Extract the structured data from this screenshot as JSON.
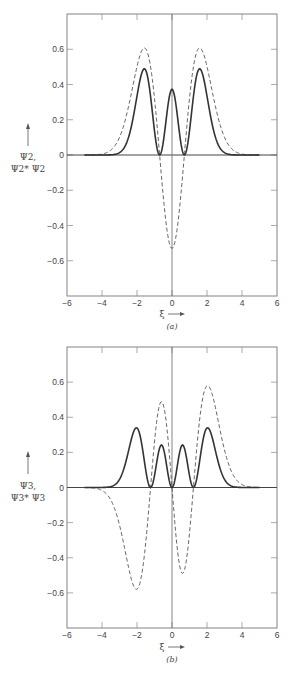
{
  "chart_data": [
    {
      "type": "line",
      "panel_label": "(a)",
      "title": "",
      "xlabel": "ξ",
      "ylabel_line1": "Ψ2,",
      "ylabel_line2": "Ψ2* Ψ2",
      "xlim": [
        -6,
        6
      ],
      "ylim": [
        -0.8,
        0.8
      ],
      "xticks": [
        -6,
        -4,
        -2,
        0,
        2,
        4,
        6
      ],
      "xtick_labels": [
        "−6",
        "−4",
        "−2",
        "0",
        "2",
        "4",
        "6"
      ],
      "yticks": [
        0.6,
        0.4,
        0.2,
        0,
        -0.2,
        -0.4,
        -0.6
      ],
      "ytick_labels": [
        "0.6",
        "0.4",
        "0.2",
        "0",
        "−0.2",
        "−0.4",
        "−0.6"
      ],
      "grid": false,
      "legend": "none",
      "series": [
        {
          "name": "Ψ2",
          "style": "dashed",
          "x": [
            -5,
            -4,
            -3,
            -2.5,
            -2,
            -1.58,
            -1,
            -0.71,
            -0.5,
            0,
            0.5,
            0.71,
            1,
            1.58,
            2,
            2.5,
            3,
            4,
            5
          ],
          "values": [
            0.0,
            0.01,
            0.09,
            0.25,
            0.5,
            0.61,
            0.32,
            0.0,
            -0.21,
            -0.53,
            -0.21,
            0.0,
            0.32,
            0.61,
            0.5,
            0.25,
            0.09,
            0.01,
            0.0
          ]
        },
        {
          "name": "Ψ2* Ψ2",
          "style": "solid",
          "x": [
            -5,
            -4,
            -3,
            -2.5,
            -2,
            -1.58,
            -1,
            -0.71,
            -0.5,
            0,
            0.5,
            0.71,
            1,
            1.58,
            2,
            2.5,
            3,
            4,
            5
          ],
          "values": [
            0.0,
            0.0,
            0.01,
            0.06,
            0.25,
            0.37,
            0.1,
            0.0,
            0.04,
            0.28,
            0.04,
            0.0,
            0.1,
            0.37,
            0.25,
            0.06,
            0.01,
            0.0,
            0.0
          ]
        }
      ],
      "params": {
        "kind": "psi2",
        "norm": 0.265
      }
    },
    {
      "type": "line",
      "panel_label": "(b)",
      "title": "",
      "xlabel": "ξ",
      "ylabel_line1": "Ψ3,",
      "ylabel_line2": "Ψ3* Ψ3",
      "xlim": [
        -6,
        6
      ],
      "ylim": [
        -0.8,
        0.8
      ],
      "xticks": [
        -6,
        -4,
        -2,
        0,
        2,
        4,
        6
      ],
      "xtick_labels": [
        "−6",
        "−4",
        "−2",
        "0",
        "2",
        "4",
        "6"
      ],
      "yticks": [
        0.6,
        0.4,
        0.2,
        0,
        -0.2,
        -0.4,
        -0.6
      ],
      "ytick_labels": [
        "0.6",
        "0.4",
        "0.2",
        "0",
        "−0.2",
        "−0.4",
        "−0.6"
      ],
      "grid": false,
      "legend": "none",
      "series": [
        {
          "name": "Ψ3",
          "style": "dashed",
          "x": [
            -5,
            -4,
            -3,
            -2.02,
            -1.5,
            -1.22,
            -0.6,
            0,
            0.6,
            1.22,
            1.5,
            2.02,
            3,
            4,
            5
          ],
          "values": [
            -0.01,
            -0.07,
            -0.31,
            -0.58,
            -0.3,
            0.0,
            0.49,
            0.0,
            -0.49,
            0.0,
            0.3,
            0.58,
            0.31,
            0.07,
            0.01
          ],
          "note": "panel shows left outer lobe ≈ -0.59, inner right ≈ -0.50"
        },
        {
          "name": "Ψ3* Ψ3",
          "style": "solid",
          "x": [
            -5,
            -4,
            -3,
            -2.02,
            -1.5,
            -1.22,
            -0.6,
            0,
            0.6,
            1.22,
            1.5,
            2.02,
            3,
            4,
            5
          ],
          "values": [
            0.0,
            0.0,
            0.1,
            0.34,
            0.09,
            0.0,
            0.24,
            0.0,
            0.24,
            0.0,
            0.09,
            0.34,
            0.1,
            0.0,
            0.0
          ]
        }
      ],
      "params": {
        "kind": "psi3",
        "norm": 0.107
      }
    }
  ]
}
